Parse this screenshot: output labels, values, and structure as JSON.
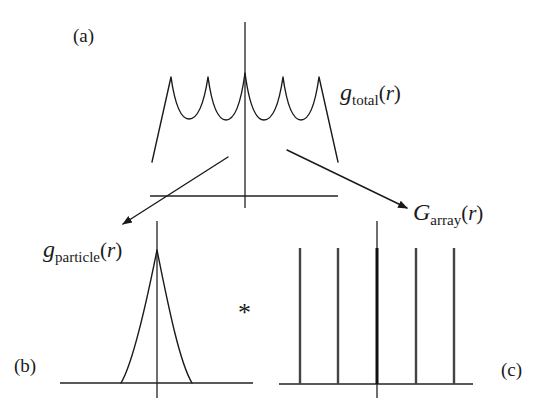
{
  "diagram": {
    "panels": {
      "a": {
        "tag": "(a)",
        "function": {
          "symbol": "g",
          "subscript": "total",
          "open": "(",
          "arg": "r",
          "close": ")"
        },
        "curve_points": [
          [
            152,
            162
          ],
          [
            171,
            77
          ],
          [
            189,
            119
          ],
          [
            208,
            77
          ],
          [
            226,
            120
          ],
          [
            245,
            73
          ],
          [
            264,
            120
          ],
          [
            283,
            77
          ],
          [
            301,
            120
          ],
          [
            319,
            77
          ],
          [
            338,
            162
          ]
        ],
        "axis_h": {
          "x1": 150,
          "x2": 338,
          "y": 196
        },
        "axis_v": {
          "x": 245,
          "y1": 22,
          "y2": 208
        }
      },
      "b": {
        "tag": "(b)",
        "function": {
          "symbol": "g",
          "subscript": "particle",
          "open": "(",
          "arg": "r",
          "close": ")"
        },
        "peak": {
          "x": 157,
          "y": 250,
          "base_left": 121,
          "base_right": 192
        },
        "axis_h": {
          "x1": 60,
          "x2": 253,
          "y": 383
        },
        "axis_v": {
          "x": 157,
          "y1": 221,
          "y2": 398
        }
      },
      "c": {
        "tag": "(c)",
        "function": {
          "symbol": "G",
          "subscript": "array",
          "open": "(",
          "arg": "r",
          "close": ")"
        },
        "spikes_x": [
          300,
          338,
          377,
          416,
          454
        ],
        "spike_top": 248,
        "axis_h": {
          "x1": 279,
          "x2": 473,
          "y": 384
        },
        "axis_v": {
          "x": 377,
          "y1": 221,
          "y2": 398
        }
      }
    },
    "operator": "*",
    "arrows": [
      {
        "name": "to-particle",
        "x1": 228,
        "y1": 157,
        "x2": 123,
        "y2": 224
      },
      {
        "name": "to-array",
        "x1": 287,
        "y1": 150,
        "x2": 407,
        "y2": 208
      }
    ],
    "colors": {
      "ink": "#1a1a1a",
      "background": "#ffffff"
    }
  }
}
